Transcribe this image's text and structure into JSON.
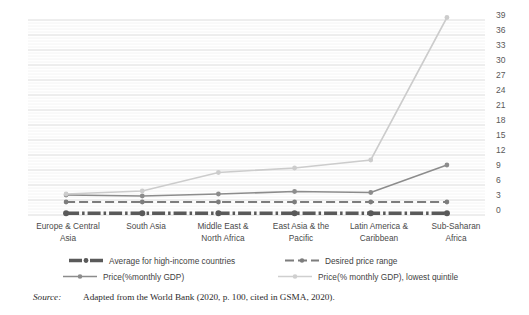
{
  "chart_data": {
    "type": "line",
    "title": "",
    "xlabel": "",
    "ylabel": "",
    "ylim": [
      0,
      39
    ],
    "yticks": [
      0,
      3,
      6,
      9,
      12,
      15,
      18,
      21,
      24,
      27,
      30,
      33,
      36,
      39
    ],
    "ytick_labels": [
      "0",
      "3",
      "6",
      "9",
      "12",
      "15",
      "18",
      "21",
      "24",
      "27",
      "30",
      "33",
      "36",
      "39"
    ],
    "y_axis_position": "right",
    "grid": true,
    "grid_orientation": "horizontal",
    "legend_position": "bottom",
    "categories": [
      "Europe & Central Asia",
      "South Asia",
      "Middle East & North Africa",
      "East Asia & the Pacific",
      "Latin America & Caribbean",
      "Sub-Saharan Africa"
    ],
    "series": [
      {
        "name": "Average for high-income countries",
        "color": "#5a5a5a",
        "style": "dash-dot-thick",
        "values": [
          0.35,
          0.35,
          0.35,
          0.35,
          0.35,
          0.35
        ]
      },
      {
        "name": "Desired price range",
        "color": "#7d7d7d",
        "style": "dashed",
        "values": [
          2.6,
          2.6,
          2.6,
          2.6,
          2.6,
          2.6
        ]
      },
      {
        "name": "Price(%monthly GDP)",
        "color": "#8c8c8c",
        "style": "solid",
        "values": [
          4.0,
          3.8,
          4.2,
          4.7,
          4.5,
          10.0
        ]
      },
      {
        "name": "Price(% monthly GDP), lowest quintile",
        "color": "#cccccc",
        "style": "solid",
        "values": [
          4.2,
          4.8,
          8.5,
          9.4,
          11.0,
          39.5
        ]
      }
    ]
  },
  "yticks": {
    "t0": "39",
    "t1": "36",
    "t2": "33",
    "t3": "30",
    "t4": "27",
    "t5": "24",
    "t6": "21",
    "t7": "18",
    "t8": "15",
    "t9": "12",
    "t10": "9",
    "t11": "6",
    "t12": "3",
    "t13": "0"
  },
  "xticks": {
    "c0_l1": "Europe & Central",
    "c0_l2": "Asia",
    "c1_l1": "South Asia",
    "c1_l2": "",
    "c2_l1": "Middle East &",
    "c2_l2": "North Africa",
    "c3_l1": "East Asia & the",
    "c3_l2": "Pacific",
    "c4_l1": "Latin America &",
    "c4_l2": "Caribbean",
    "c5_l1": "Sub-Saharan",
    "c5_l2": "Africa"
  },
  "legend": {
    "item0": "Average for high-income countries",
    "item1": "Desired price range",
    "item2": "Price(%monthly GDP)",
    "item3": "Price(% monthly GDP), lowest quintile"
  },
  "source": {
    "label": "Source:",
    "text": "Adapted from the World Bank (2020, p. 100, cited in GSMA, 2020)."
  }
}
